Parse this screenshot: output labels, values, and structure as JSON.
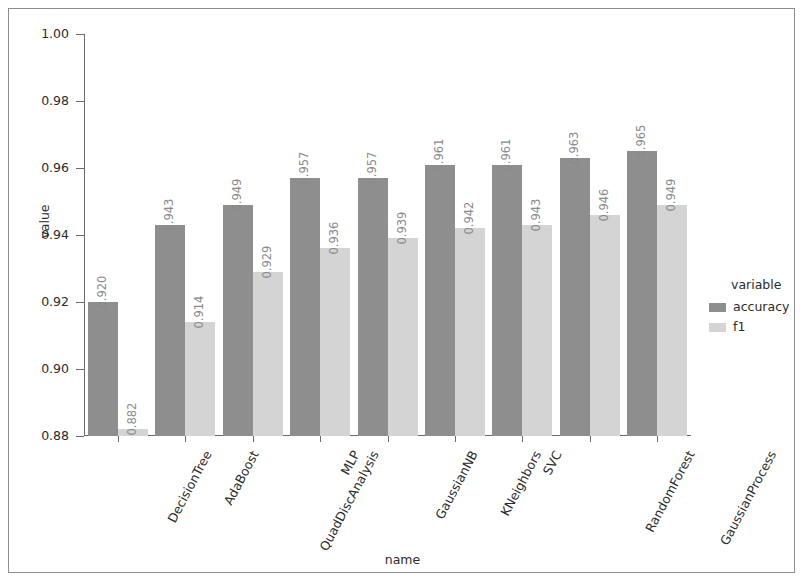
{
  "chart_data": {
    "type": "bar",
    "title": "",
    "xlabel": "name",
    "ylabel": "value",
    "ylim": [
      0.88,
      1.0
    ],
    "yticks": [
      "0.88",
      "0.90",
      "0.92",
      "0.94",
      "0.96",
      "0.98",
      "1.00"
    ],
    "ytick_values": [
      0.88,
      0.9,
      0.92,
      0.94,
      0.96,
      0.98,
      1.0
    ],
    "grid": false,
    "legend_position": "right",
    "legend_title": "variable",
    "categories": [
      "DecisionTree",
      "AdaBoost",
      "QuadDiscAnalysis",
      "MLP",
      "GaussianNB",
      "KNeighbors",
      "SVC",
      "RandomForest",
      "GaussianProcess"
    ],
    "series": [
      {
        "name": "accuracy",
        "color": "#8e8e8e",
        "values": [
          0.92,
          0.943,
          0.949,
          0.957,
          0.957,
          0.961,
          0.961,
          0.963,
          0.965
        ],
        "labels": [
          "0.920",
          "0.943",
          "0.949",
          "0.957",
          "0.957",
          "0.961",
          "0.961",
          "0.963",
          "0.965"
        ]
      },
      {
        "name": "f1",
        "color": "#d4d4d4",
        "values": [
          0.882,
          0.914,
          0.929,
          0.936,
          0.939,
          0.942,
          0.943,
          0.946,
          0.949
        ],
        "labels": [
          "0.882",
          "0.914",
          "0.929",
          "0.936",
          "0.939",
          "0.942",
          "0.943",
          "0.946",
          "0.949"
        ]
      }
    ]
  },
  "legend": {
    "title": "variable",
    "entries": [
      {
        "label": "accuracy",
        "color": "#8e8e8e"
      },
      {
        "label": "f1",
        "color": "#d4d4d4"
      }
    ]
  },
  "axes": {
    "x_title": "name",
    "y_title": "value"
  }
}
